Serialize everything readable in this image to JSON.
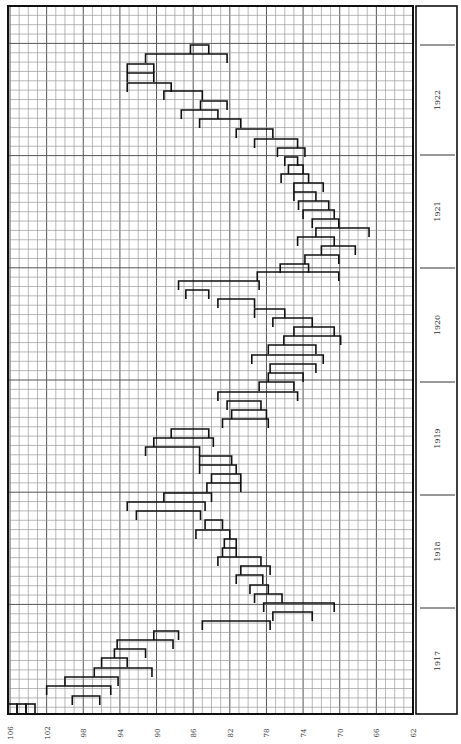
{
  "chart_data": {
    "type": "range-bar",
    "title": "",
    "orientation": "rotated-90 (months run bottom-to-top, price axis runs left (high) to right (low))",
    "xlabel": "",
    "ylabel": "",
    "x_axis": {
      "ticks": [
        106,
        102,
        98,
        94,
        90,
        86,
        82,
        78,
        74,
        70,
        66,
        62
      ],
      "range": [
        106,
        62
      ],
      "minor_step": 1,
      "grid": true
    },
    "year_bands": [
      {
        "label": "1922",
        "y_top": 45,
        "y_bottom": 155
      },
      {
        "label": "1921",
        "y_top": 155,
        "y_bottom": 268
      },
      {
        "label": "1920",
        "y_top": 268,
        "y_bottom": 382
      },
      {
        "label": "1919",
        "y_top": 382,
        "y_bottom": 495
      },
      {
        "label": "1918",
        "y_top": 495,
        "y_bottom": 608
      },
      {
        "label": "1917",
        "y_top": 608,
        "y_bottom": 714
      }
    ],
    "series": [
      {
        "name": "monthly price range (high–low)",
        "bars": [
          {
            "y": 45,
            "high": 86.3,
            "low": 84.3
          },
          {
            "y": 54,
            "high": 91.2,
            "low": 82.3
          },
          {
            "y": 64,
            "high": 93.2,
            "low": 90.3
          },
          {
            "y": 73,
            "high": 93.2,
            "low": 90.3
          },
          {
            "y": 83,
            "high": 93.2,
            "low": 88.4
          },
          {
            "y": 91,
            "high": 89.2,
            "low": 85.0
          },
          {
            "y": 101,
            "high": 85.2,
            "low": 82.3
          },
          {
            "y": 110,
            "high": 87.3,
            "low": 83.3
          },
          {
            "y": 119,
            "high": 85.3,
            "low": 80.8
          },
          {
            "y": 129,
            "high": 81.3,
            "low": 77.3
          },
          {
            "y": 139,
            "high": 79.3,
            "low": 74.6
          },
          {
            "y": 148,
            "high": 76.8,
            "low": 73.8
          },
          {
            "y": 157,
            "high": 76.0,
            "low": 74.6
          },
          {
            "y": 165,
            "high": 75.6,
            "low": 74.0
          },
          {
            "y": 174,
            "high": 76.4,
            "low": 73.4
          },
          {
            "y": 183,
            "high": 75.0,
            "low": 71.8
          },
          {
            "y": 192,
            "high": 75.0,
            "low": 72.6
          },
          {
            "y": 201,
            "high": 74.5,
            "low": 71.2
          },
          {
            "y": 210,
            "high": 74.0,
            "low": 70.6
          },
          {
            "y": 219,
            "high": 73.0,
            "low": 70.1
          },
          {
            "y": 228,
            "high": 72.6,
            "low": 66.8
          },
          {
            "y": 237,
            "high": 74.6,
            "low": 70.6
          },
          {
            "y": 246,
            "high": 72.0,
            "low": 68.3
          },
          {
            "y": 255,
            "high": 73.8,
            "low": 70.1
          },
          {
            "y": 264,
            "high": 76.5,
            "low": 73.4
          },
          {
            "y": 272,
            "high": 79.0,
            "low": 70.1
          },
          {
            "y": 281,
            "high": 87.6,
            "low": 78.8
          },
          {
            "y": 290,
            "high": 86.8,
            "low": 84.3
          },
          {
            "y": 299,
            "high": 83.3,
            "low": 79.3
          },
          {
            "y": 309,
            "high": 79.3,
            "low": 76.0
          },
          {
            "y": 318,
            "high": 77.3,
            "low": 73.0
          },
          {
            "y": 327,
            "high": 75.0,
            "low": 70.6
          },
          {
            "y": 336,
            "high": 76.1,
            "low": 69.9
          },
          {
            "y": 345,
            "high": 77.8,
            "low": 72.6
          },
          {
            "y": 355,
            "high": 79.6,
            "low": 71.8
          },
          {
            "y": 364,
            "high": 77.6,
            "low": 72.6
          },
          {
            "y": 373,
            "high": 77.8,
            "low": 74.0
          },
          {
            "y": 382,
            "high": 78.8,
            "low": 75.0
          },
          {
            "y": 392,
            "high": 83.3,
            "low": 74.6
          },
          {
            "y": 401,
            "high": 82.3,
            "low": 78.6
          },
          {
            "y": 410,
            "high": 81.8,
            "low": 78.0
          },
          {
            "y": 419,
            "high": 82.8,
            "low": 77.8
          },
          {
            "y": 429,
            "high": 88.4,
            "low": 84.3
          },
          {
            "y": 438,
            "high": 90.3,
            "low": 83.8
          },
          {
            "y": 447,
            "high": 91.2,
            "low": 85.3
          },
          {
            "y": 456,
            "high": 85.3,
            "low": 81.8
          },
          {
            "y": 465,
            "high": 85.3,
            "low": 81.3
          },
          {
            "y": 474,
            "high": 84.0,
            "low": 80.8
          },
          {
            "y": 483,
            "high": 84.5,
            "low": 80.8
          },
          {
            "y": 493,
            "high": 89.2,
            "low": 84.0
          },
          {
            "y": 502,
            "high": 93.2,
            "low": 84.7
          },
          {
            "y": 511,
            "high": 92.2,
            "low": 85.2
          },
          {
            "y": 520,
            "high": 84.7,
            "low": 82.8
          },
          {
            "y": 530,
            "high": 85.7,
            "low": 82.0
          },
          {
            "y": 539,
            "high": 82.6,
            "low": 81.3
          },
          {
            "y": 548,
            "high": 82.8,
            "low": 81.3
          },
          {
            "y": 557,
            "high": 83.3,
            "low": 78.6
          },
          {
            "y": 566,
            "high": 80.8,
            "low": 77.6
          },
          {
            "y": 575,
            "high": 81.3,
            "low": 78.4
          },
          {
            "y": 585,
            "high": 79.8,
            "low": 77.8
          },
          {
            "y": 594,
            "high": 79.3,
            "low": 76.3
          },
          {
            "y": 603,
            "high": 78.3,
            "low": 70.6
          },
          {
            "y": 612,
            "high": 77.3,
            "low": 73.0
          },
          {
            "y": 621,
            "high": 85.0,
            "low": 77.6
          },
          {
            "y": 631,
            "high": 90.3,
            "low": 87.6
          },
          {
            "y": 640,
            "high": 94.3,
            "low": 88.2
          },
          {
            "y": 649,
            "high": 94.6,
            "low": 91.2
          },
          {
            "y": 658,
            "high": 96.0,
            "low": 93.2
          },
          {
            "y": 668,
            "high": 96.8,
            "low": 90.5
          },
          {
            "y": 677,
            "high": 100.0,
            "low": 94.2
          },
          {
            "y": 686,
            "high": 102.0,
            "low": 95.0
          },
          {
            "y": 696,
            "high": 99.2,
            "low": 96.2
          }
        ]
      }
    ],
    "legend": null,
    "annotations": [
      "106",
      "102",
      "98",
      "94",
      "90",
      "86",
      "82",
      "78",
      "74",
      "70",
      "66",
      "62"
    ]
  },
  "labels": {
    "x_ticks": [
      "106",
      "102",
      "98",
      "94",
      "90",
      "86",
      "82",
      "78",
      "74",
      "70",
      "66",
      "62"
    ],
    "years": [
      "1922",
      "1921",
      "1920",
      "1919",
      "1918",
      "1917"
    ]
  }
}
